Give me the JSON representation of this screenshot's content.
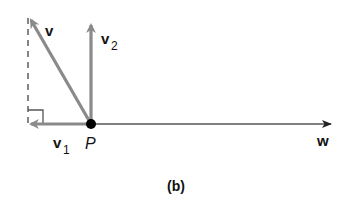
{
  "figure": {
    "caption": "(b)",
    "point": {
      "label": "P"
    },
    "vectors": {
      "v": {
        "label": "v",
        "subscript": ""
      },
      "v2": {
        "label": "v",
        "subscript": "2"
      },
      "v1": {
        "label": "v",
        "subscript": "1"
      },
      "w": {
        "label": "w",
        "subscript": ""
      }
    },
    "colors": {
      "vector_gray": "#8a8a8a",
      "axis_line": "#555555",
      "point": "#000000",
      "dashed": "#444444"
    }
  }
}
